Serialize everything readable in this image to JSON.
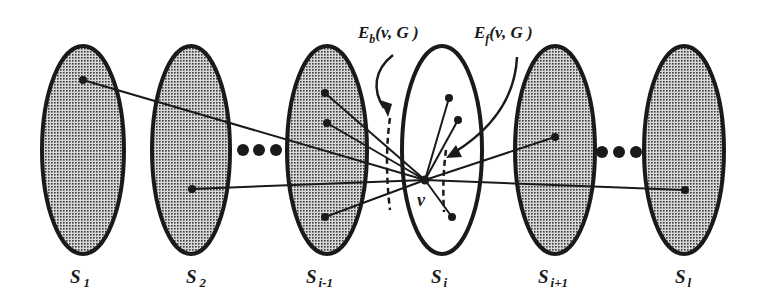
{
  "diagram": {
    "colors": {
      "ink": "#1a1a1a",
      "set_fill": "#9a9a9a",
      "highlight_fill": "#ffffff",
      "background": "#ffffff"
    },
    "sets": [
      {
        "id": "S1",
        "base": "S",
        "sub": "1",
        "cx": 83,
        "cy": 150,
        "rx": 41,
        "ry": 104,
        "shaded": true
      },
      {
        "id": "S2",
        "base": "S",
        "sub": "2",
        "cx": 191,
        "cy": 150,
        "rx": 39,
        "ry": 104,
        "shaded": true
      },
      {
        "id": "Si-1",
        "base": "S",
        "sub": "i-1",
        "cx": 327,
        "cy": 150,
        "rx": 40,
        "ry": 104,
        "shaded": true
      },
      {
        "id": "Si",
        "base": "S",
        "sub": "i",
        "cx": 442,
        "cy": 150,
        "rx": 40,
        "ry": 104,
        "shaded": false
      },
      {
        "id": "Si+1",
        "base": "S",
        "sub": "i+1",
        "cx": 555,
        "cy": 150,
        "rx": 40,
        "ry": 104,
        "shaded": true
      },
      {
        "id": "Sl",
        "base": "S",
        "sub": "l",
        "cx": 684,
        "cy": 150,
        "rx": 40,
        "ry": 104,
        "shaded": true
      }
    ],
    "ellipsis_markers": [
      {
        "between": [
          "S2",
          "Si-1"
        ],
        "dots_x": [
          243,
          259,
          276
        ],
        "y": 150
      },
      {
        "between": [
          "Si+1",
          "Sl"
        ],
        "dots_x": [
          602,
          619,
          636
        ],
        "y": 152
      }
    ],
    "vertex": {
      "label": "v",
      "x": 425,
      "y": 180
    },
    "endpoints": [
      {
        "set": "S1",
        "x": 83,
        "y": 80
      },
      {
        "set": "S2",
        "x": 192,
        "y": 189
      },
      {
        "set": "Si-1",
        "x": 325,
        "y": 93
      },
      {
        "set": "Si-1",
        "x": 327,
        "y": 123
      },
      {
        "set": "Si-1",
        "x": 325,
        "y": 217
      },
      {
        "set": "Si",
        "x": 449,
        "y": 98
      },
      {
        "set": "Si",
        "x": 458,
        "y": 120
      },
      {
        "set": "Si",
        "x": 452,
        "y": 217
      },
      {
        "set": "Si+1",
        "x": 555,
        "y": 137
      },
      {
        "set": "Sl",
        "x": 685,
        "y": 190
      }
    ],
    "edge_sets": [
      {
        "id": "Eb",
        "base": "E",
        "sub": "b",
        "args": "(v, G )",
        "x": 358,
        "y": 38
      },
      {
        "id": "Ef",
        "base": "E",
        "sub": "f",
        "args": "(v, G )",
        "x": 474,
        "y": 38
      }
    ]
  }
}
